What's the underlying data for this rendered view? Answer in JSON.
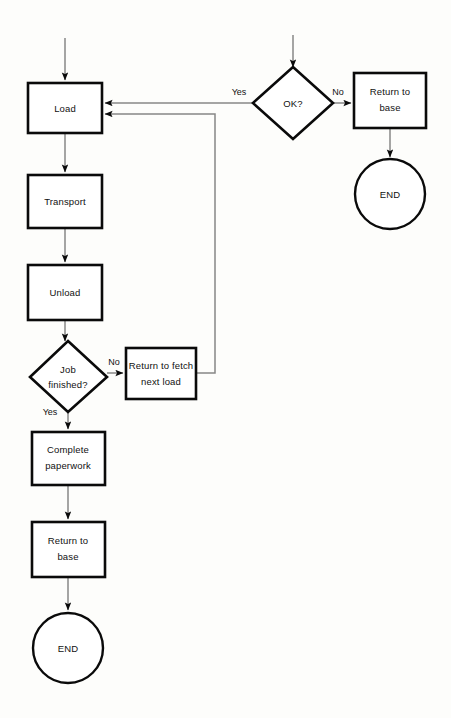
{
  "diagram": {
    "type": "flowchart",
    "title": "",
    "background_color": "#fdfdfb",
    "shape_border_color": "#0a0a0a",
    "connector_color": "#878787",
    "nodes": {
      "load": {
        "label": "Load",
        "shape": "rectangle"
      },
      "transport": {
        "label": "Transport",
        "shape": "rectangle"
      },
      "unload": {
        "label": "Unload",
        "shape": "rectangle"
      },
      "job_finished": {
        "label_line1": "Job",
        "label_line2": "finished?",
        "shape": "diamond"
      },
      "return_fetch": {
        "label_line1": "Return to fetch",
        "label_line2": "next load",
        "shape": "rectangle"
      },
      "complete_paperwork": {
        "label_line1": "Complete",
        "label_line2": "paperwork",
        "shape": "rectangle"
      },
      "return_base_bottom": {
        "label_line1": "Return to",
        "label_line2": "base",
        "shape": "rectangle"
      },
      "end_bottom": {
        "label": "END",
        "shape": "circle"
      },
      "ok_decision": {
        "label": "OK?",
        "shape": "diamond"
      },
      "return_base_top": {
        "label_line1": "Return to",
        "label_line2": "base",
        "shape": "rectangle"
      },
      "end_top": {
        "label": "END",
        "shape": "circle"
      }
    },
    "edge_labels": {
      "ok_yes": "Yes",
      "ok_no": "No",
      "job_no": "No",
      "job_yes": "Yes"
    }
  }
}
